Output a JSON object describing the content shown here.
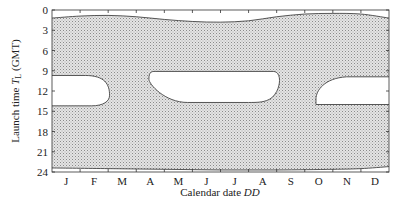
{
  "chart_data": {
    "type": "area",
    "title": "",
    "xlabel": "Calendar date DD",
    "xlabel_plain": "Calendar date ",
    "xlabel_italic": "DD",
    "ylabel": "Launch time T_L (GMT)",
    "ylabel_plain": "Launch time ",
    "ylabel_T": "T",
    "ylabel_sub": "L",
    "ylabel_suffix": " (GMT)",
    "x_categories": [
      "J",
      "F",
      "M",
      "A",
      "M",
      "J",
      "J",
      "A",
      "S",
      "O",
      "N",
      "D"
    ],
    "y_ticks": [
      0,
      3,
      6,
      9,
      12,
      15,
      18,
      21,
      24
    ],
    "ylim": [
      0,
      24
    ],
    "y_inverted": true,
    "grid": false,
    "legend": null,
    "fill": "stippled gray (allowed launch window)",
    "regions": {
      "upper_boundary": {
        "description": "Top edge of shaded region (hours GMT) vs month",
        "month": [
          0,
          1,
          2,
          3,
          4,
          5,
          6,
          7,
          8,
          9,
          10,
          11,
          12
        ],
        "hour": [
          1.2,
          0.9,
          0.8,
          1.0,
          1.4,
          1.7,
          1.8,
          1.6,
          1.0,
          0.6,
          0.5,
          0.6,
          1.2
        ]
      },
      "lower_boundary": {
        "description": "Bottom edge of shaded region (hours GMT) vs month",
        "month": [
          0,
          2,
          4,
          6,
          8,
          10,
          11,
          12
        ],
        "hour": [
          23.4,
          23.5,
          23.6,
          23.7,
          23.7,
          23.6,
          23.5,
          23.2
        ]
      },
      "excluded_windows": [
        {
          "name": "Jan-Feb gap",
          "month_start": 0.0,
          "month_end": 2.05,
          "hour_top": 9.7,
          "hour_bottom": 14.2
        },
        {
          "name": "Apr-Aug gap",
          "month_start": 3.45,
          "month_end": 8.1,
          "hour_top": 9.1,
          "hour_bottom": 13.7
        },
        {
          "name": "Oct-Dec gap",
          "month_start": 9.4,
          "month_end": 12.0,
          "hour_top": 9.9,
          "hour_bottom": 14.0
        }
      ]
    }
  }
}
